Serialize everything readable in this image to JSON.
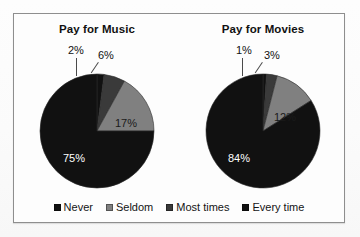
{
  "figure": {
    "background_color": "#fdfdfd",
    "frame_color": "#8e8e8e"
  },
  "legend": {
    "position": "bottom-center",
    "items": [
      {
        "label": "Never",
        "color": "#111111"
      },
      {
        "label": "Seldom",
        "color": "#808080"
      },
      {
        "label": "Most times",
        "color": "#3a3a3a"
      },
      {
        "label": "Every time",
        "color": "#111111"
      }
    ]
  },
  "charts": [
    {
      "title": "Pay for Music",
      "labels": {
        "every_time": "2%",
        "most_times": "6%",
        "seldom": "17%",
        "never": "75%"
      }
    },
    {
      "title": "Pay for Movies",
      "labels": {
        "every_time": "1%",
        "most_times": "3%",
        "seldom": "12%",
        "never": "84%"
      }
    }
  ],
  "chart_data": [
    {
      "type": "pie",
      "title": "Pay for Music",
      "categories": [
        "Every time",
        "Most times",
        "Seldom",
        "Never"
      ],
      "values": [
        2,
        6,
        17,
        75
      ],
      "value_labels": [
        "2%",
        "6%",
        "17%",
        "75%"
      ],
      "colors": [
        "#111111",
        "#3a3a3a",
        "#808080",
        "#111111"
      ],
      "units": "percent",
      "start_angle_deg": 0,
      "direction": "clockwise",
      "legend": "bottom",
      "xlabel": "",
      "ylabel": ""
    },
    {
      "type": "pie",
      "title": "Pay for Movies",
      "categories": [
        "Every time",
        "Most times",
        "Seldom",
        "Never"
      ],
      "values": [
        1,
        3,
        12,
        84
      ],
      "value_labels": [
        "1%",
        "3%",
        "12%",
        "84%"
      ],
      "colors": [
        "#111111",
        "#3a3a3a",
        "#808080",
        "#111111"
      ],
      "units": "percent",
      "start_angle_deg": 0,
      "direction": "clockwise",
      "legend": "bottom",
      "xlabel": "",
      "ylabel": ""
    }
  ]
}
